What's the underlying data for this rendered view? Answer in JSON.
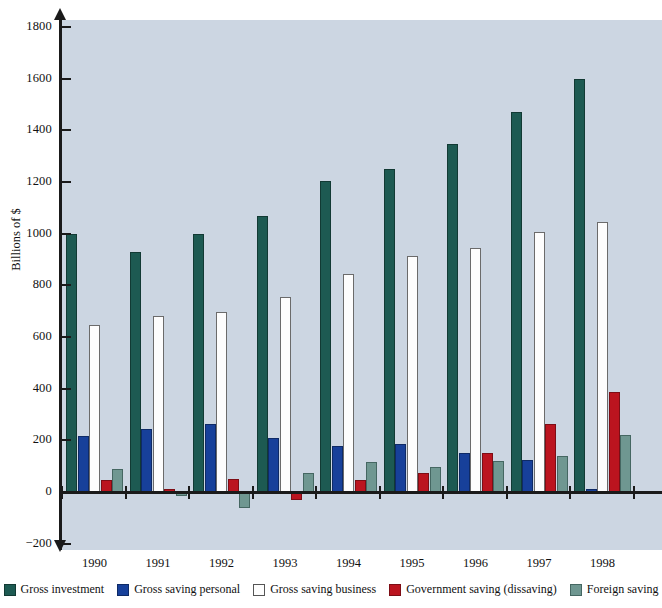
{
  "chart_data": {
    "type": "bar",
    "title": "",
    "subtitle": "",
    "xlabel": "",
    "ylabel": "Billions of $",
    "categories": [
      "1990",
      "1991",
      "1992",
      "1993",
      "1994",
      "1995",
      "1996",
      "1997",
      "1998"
    ],
    "ylim": [
      -200,
      1800
    ],
    "yticks": [
      -200,
      0,
      200,
      400,
      600,
      800,
      1000,
      1200,
      1400,
      1600,
      1800
    ],
    "ytick_labels": [
      "−200",
      "0",
      "200",
      "400",
      "600",
      "800",
      "1000",
      "1200",
      "1400",
      "1600",
      "1800"
    ],
    "grid": false,
    "legend_position": "bottom",
    "series": [
      {
        "name": "Gross investment",
        "key": "investment",
        "color": "#1d5a52",
        "values": [
          1000,
          930,
          998,
          1070,
          1205,
          1250,
          1348,
          1470,
          1600
        ]
      },
      {
        "name": "Gross saving personal",
        "key": "personal",
        "color": "#17409a",
        "values": [
          218,
          243,
          262,
          210,
          180,
          185,
          152,
          125,
          10
        ]
      },
      {
        "name": "Gross saving business",
        "key": "business",
        "color": "#fdfdfd",
        "values": [
          645,
          680,
          695,
          755,
          842,
          915,
          945,
          1008,
          1045
        ]
      },
      {
        "name": "Government saving (dissaving)",
        "key": "government",
        "color": "#bb141f",
        "values": [
          48,
          10,
          50,
          -30,
          48,
          72,
          152,
          262,
          388
        ]
      },
      {
        "name": "Foreign saving",
        "key": "foreign",
        "color": "#6f9791",
        "values": [
          88,
          -15,
          -60,
          75,
          118,
          98,
          120,
          138,
          222
        ]
      }
    ]
  },
  "legend": {
    "items": [
      {
        "label": "Gross investment",
        "key": "investment"
      },
      {
        "label": "Gross saving personal",
        "key": "personal"
      },
      {
        "label": "Gross saving business",
        "key": "business"
      },
      {
        "label": "Government saving (dissaving)",
        "key": "government"
      },
      {
        "label": "Foreign saving",
        "key": "foreign"
      }
    ]
  }
}
